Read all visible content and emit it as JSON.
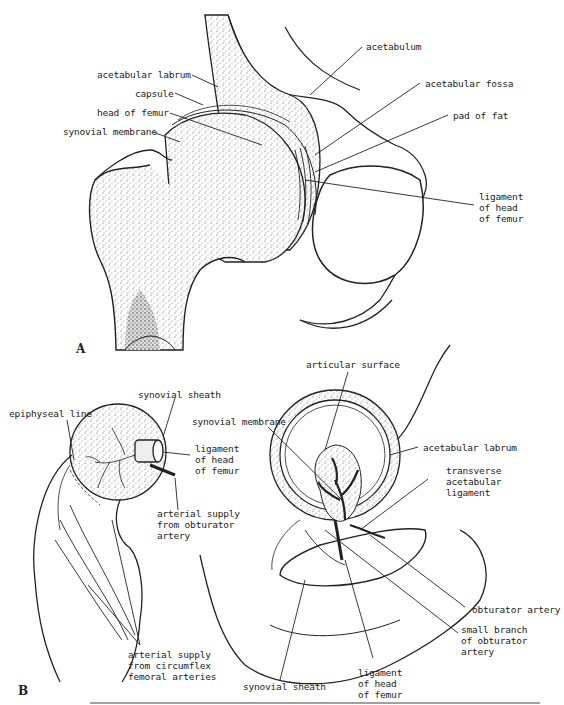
{
  "figure": {
    "panel_a": {
      "letter": "A",
      "labels": {
        "acetabulum": "acetabulum",
        "acetabular_labrum": "acetabular labrum",
        "capsule": "capsule",
        "head_of_femur": "head of femur",
        "synovial_membrane": "synovial membrane",
        "acetabular_fossa": "acetabular fossa",
        "pad_of_fat": "pad of fat",
        "ligament_of_head_of_femur": "ligament\nof head\nof femur"
      }
    },
    "panel_b": {
      "letter": "B",
      "labels": {
        "epiphyseal_line": "epiphyseal line",
        "synovial_sheath_top": "synovial sheath",
        "ligament_of_head_of_femur_left": "ligament\nof head\nof femur",
        "arterial_supply_obturator": "arterial supply\nfrom obturator\nartery",
        "arterial_supply_circumflex": "arterial supply\nfrom circumflex\nfemoral arteries",
        "articular_surface": "articular surface",
        "synovial_membrane": "synovial membrane",
        "acetabular_labrum": "acetabular labrum",
        "transverse_acetabular_ligament": "transverse\nacetabular\nligament",
        "obturator_artery": "obturator artery",
        "small_branch_obturator": "small branch\nof obturator\nartery",
        "ligament_of_head_of_femur_bottom": "ligament\nof head\nof femur",
        "synovial_sheath_bottom": "synovial sheath"
      }
    }
  }
}
